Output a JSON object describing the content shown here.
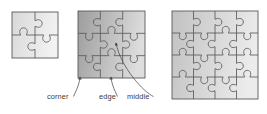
{
  "figure": {
    "background_color": "#ffffff",
    "piece_outline_color": "#5a5a5a",
    "leader_line_color": "#4a4a4a",
    "label_text_color": "#3a3a3a"
  },
  "puzzles": [
    {
      "id": "puzzle-2x2",
      "name": "2x2 jigsaw puzzle",
      "rows": 2,
      "columns": 2,
      "pieces": 4,
      "x": 12,
      "y": 12,
      "width": 46,
      "height": 46,
      "fill_start": "#d8d8d8",
      "fill_end": "#f2f2f2"
    },
    {
      "id": "puzzle-3x3",
      "name": "3x3 jigsaw puzzle",
      "rows": 3,
      "columns": 3,
      "pieces": 9,
      "x": 78,
      "y": 11,
      "width": 67,
      "height": 67,
      "fill_start": "#9e9e9e",
      "fill_end": "#dedede"
    },
    {
      "id": "puzzle-4x4",
      "name": "4x4 jigsaw puzzle",
      "rows": 4,
      "columns": 4,
      "pieces": 16,
      "x": 172,
      "y": 11,
      "width": 86,
      "height": 88,
      "fill_start": "#c2c2c2",
      "fill_end": "#ececec"
    }
  ],
  "annotations": [
    {
      "id": "annotation-corner",
      "label": "corner",
      "text_x": 47,
      "text_y": 99,
      "target_x": 80,
      "target_y": 77,
      "describes": "corner piece of the 3x3 puzzle"
    },
    {
      "id": "annotation-edge",
      "label": "edge",
      "text_x": 99,
      "text_y": 99,
      "target_x": 111,
      "target_y": 77,
      "describes": "edge piece of the 3x3 puzzle"
    },
    {
      "id": "annotation-middle",
      "label": "middle",
      "text_x": 127,
      "text_y": 99,
      "target_x": 116,
      "target_y": 43,
      "describes": "middle piece of the 3x3 puzzle"
    }
  ]
}
